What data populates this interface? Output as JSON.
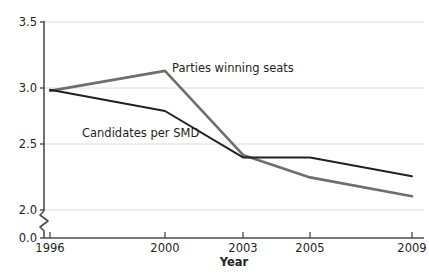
{
  "chart_data": {
    "type": "line",
    "title": "",
    "xlabel": "Year",
    "ylabel": "",
    "categories": [
      "1996",
      "2000",
      "2003",
      "2005",
      "2009"
    ],
    "x": [
      1996,
      2000,
      2003,
      2005,
      2009
    ],
    "xtick_labels": [
      "1996",
      "2000",
      "2003",
      "2005",
      "2009"
    ],
    "ytick_labels": [
      "0.0",
      "2.0",
      "2.5",
      "3.0",
      "3.5"
    ],
    "ytick_values": [
      0.0,
      2.0,
      2.5,
      3.0,
      3.5
    ],
    "ylim": [
      2.0,
      3.5
    ],
    "y_axis_break": true,
    "y_axis_break_note": "axis broken between 0.0 and 2.0",
    "grid": "horizontal",
    "legend_position": "inline-annotations",
    "series": [
      {
        "name": "Parties winning seats",
        "color": "#6e6e6e",
        "values": [
          2.95,
          3.11,
          2.44,
          2.26,
          2.11
        ],
        "annotation": "Parties winning seats"
      },
      {
        "name": "Candidates per SMD",
        "color": "#231f20",
        "values": [
          2.96,
          2.79,
          2.42,
          2.42,
          2.27
        ],
        "annotation": "Candidates per SMD"
      }
    ],
    "annotations": [
      {
        "text": "Parties winning seats",
        "series": "Parties winning seats"
      },
      {
        "text": "Candidates per SMD",
        "series": "Candidates per SMD"
      }
    ]
  },
  "axes": {
    "x_title": "Year",
    "y_ticks": [
      {
        "label": "3.5"
      },
      {
        "label": "3.0"
      },
      {
        "label": "2.5"
      },
      {
        "label": "2.0"
      },
      {
        "label": "0.0"
      }
    ],
    "x_ticks": [
      {
        "label": "1996"
      },
      {
        "label": "2000"
      },
      {
        "label": "2003"
      },
      {
        "label": "2005"
      },
      {
        "label": "2009"
      }
    ]
  },
  "colors": {
    "series_gray": "#6e6e6e",
    "series_black": "#231f20",
    "gridline": "#e8e8e8",
    "axis": "#4d4d4d",
    "background": "#ffffff"
  }
}
